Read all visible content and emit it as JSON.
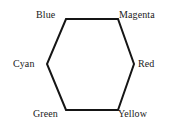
{
  "diagram": {
    "shape": "hexagon",
    "stroke_color": "#151515",
    "fill_color": "#ffffff",
    "background_color": "#ffffff",
    "stroke_width": 2,
    "vertices": [
      {
        "id": "blue",
        "label": "Blue",
        "position": "top-left",
        "x": 66,
        "y": 19
      },
      {
        "id": "magenta",
        "label": "Magenta",
        "position": "top-right",
        "x": 118,
        "y": 19
      },
      {
        "id": "red",
        "label": "Red",
        "position": "right",
        "x": 134,
        "y": 64
      },
      {
        "id": "yellow",
        "label": "Yellow",
        "position": "bottom-right",
        "x": 118,
        "y": 110
      },
      {
        "id": "green",
        "label": "Green",
        "position": "bottom-left",
        "x": 66,
        "y": 110
      },
      {
        "id": "cyan",
        "label": "Cyan",
        "position": "left",
        "x": 47,
        "y": 64
      }
    ],
    "polygon_points": "66,19 118,19 134,64 118,110 66,110 47,64"
  }
}
